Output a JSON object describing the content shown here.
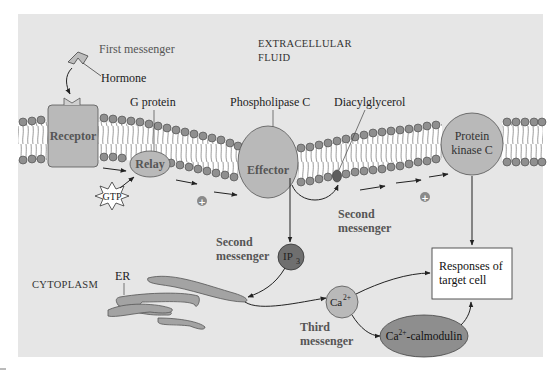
{
  "figure": {
    "regions": {
      "extracellular_line1": "Extracellular",
      "extracellular_line2": "Fluid",
      "cytoplasm": "Cytoplasm"
    },
    "labels": {
      "first_messenger": "First messenger",
      "hormone": "Hormone",
      "g_protein": "G protein",
      "phospholipase_c": "Phospholipase C",
      "diacylglycerol": "Diacylglycerol",
      "second_messenger_a_line1": "Second",
      "second_messenger_a_line2": "messenger",
      "second_messenger_b_line1": "Second",
      "second_messenger_b_line2": "messenger",
      "third_messenger_line1": "Third",
      "third_messenger_line2": "messenger",
      "er": "ER"
    },
    "nodes": {
      "receptor": "Receptor",
      "relay": "Relay",
      "gtp": "GTP",
      "effector": "Effector",
      "protein_kinase_c_line1": "Protein",
      "protein_kinase_c_line2": "kinase C",
      "ip3_base": "IP",
      "ip3_sub": "3",
      "ca_base": "Ca",
      "ca_sup": "2+",
      "calmodulin_base": "Ca",
      "calmodulin_sup": "2+",
      "calmodulin_rest": "-calmodulin",
      "responses_line1": "Responses of",
      "responses_line2": "target cell"
    },
    "symbols": {
      "plus": "+"
    },
    "colors": {
      "panel_bg": "#e6e6e6",
      "protein_fill": "#b9b9b9",
      "dark_fill": "#6f6f6f",
      "calmodulin_fill": "#8e8e8e",
      "lipid_head": "#8f8f8f",
      "box_fill": "#ffffff"
    }
  }
}
